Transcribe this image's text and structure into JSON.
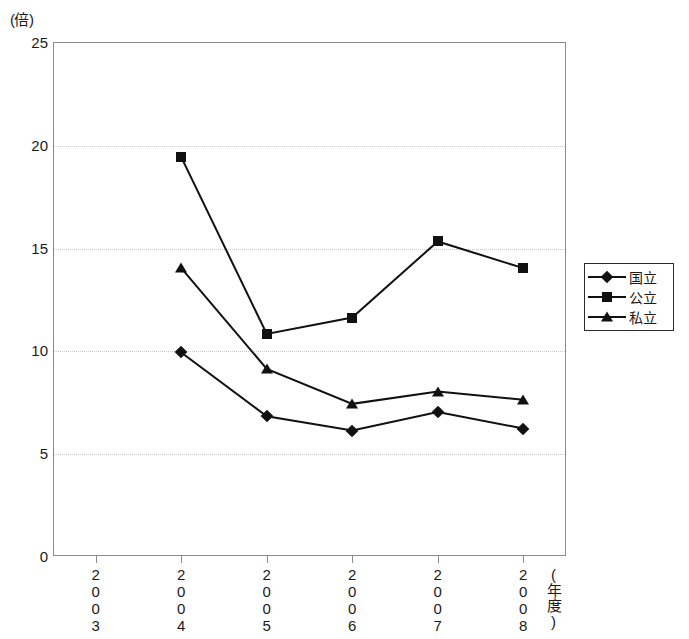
{
  "chart_data": {
    "type": "line",
    "title": "",
    "xlabel": "(年度)",
    "ylabel": "(倍)",
    "categories": [
      "2003",
      "2004",
      "2005",
      "2006",
      "2007",
      "2008"
    ],
    "ylim": [
      0,
      25
    ],
    "yticks": [
      "0",
      "5",
      "10",
      "15",
      "20",
      "25"
    ],
    "grid": true,
    "legend_position": "right",
    "series": [
      {
        "name": "国立",
        "marker": "diamond",
        "values": [
          null,
          9.9,
          6.8,
          6.1,
          7.0,
          6.2
        ]
      },
      {
        "name": "公立",
        "marker": "square",
        "values": [
          null,
          19.4,
          10.8,
          11.6,
          15.3,
          14.0
        ]
      },
      {
        "name": "私立",
        "marker": "triangle",
        "values": [
          null,
          14.0,
          9.1,
          7.4,
          8.0,
          7.6
        ]
      }
    ],
    "colors": {
      "series_line": "#111111",
      "frame": "#8a8a8a",
      "gridline": "#c8c8c8"
    }
  },
  "axis": {
    "y_unit": "(倍)",
    "x_title": "(年度)"
  },
  "legend": {
    "entries": [
      {
        "label": "国立",
        "marker": "diamond"
      },
      {
        "label": "公立",
        "marker": "square"
      },
      {
        "label": "私立",
        "marker": "triangle"
      }
    ]
  }
}
